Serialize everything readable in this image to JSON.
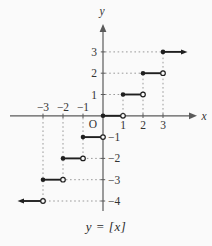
{
  "figure": {
    "caption": "y = [x]",
    "x_axis_label": "x",
    "y_axis_label": "y",
    "origin_label": "O"
  },
  "chart_data": {
    "type": "line",
    "subtype": "step-function",
    "function": "floor",
    "title": "y = [x]",
    "xlabel": "x",
    "ylabel": "y",
    "xlim": [
      -4.6,
      4.7
    ],
    "ylim": [
      -4.6,
      4.4
    ],
    "grid": "dotted-guides-only",
    "colors": {
      "line": "#1f1f1f",
      "axis": "#5a5a5a",
      "guide": "#9a9a9a",
      "label": "#333333",
      "background": "#fafafa"
    },
    "segments": [
      {
        "y": -4,
        "from": -4.05,
        "to": -3,
        "start": "arrow",
        "end": "open"
      },
      {
        "y": -3,
        "from": -3,
        "to": -2,
        "start": "closed",
        "end": "open"
      },
      {
        "y": -2,
        "from": -2,
        "to": -1,
        "start": "closed",
        "end": "open"
      },
      {
        "y": -1,
        "from": -1,
        "to": 0,
        "start": "closed",
        "end": "open"
      },
      {
        "y": 0,
        "from": 0,
        "to": 1,
        "start": "closed",
        "end": "open"
      },
      {
        "y": 1,
        "from": 1,
        "to": 2,
        "start": "closed",
        "end": "open"
      },
      {
        "y": 2,
        "from": 2,
        "to": 3,
        "start": "closed",
        "end": "open"
      },
      {
        "y": 3,
        "from": 3,
        "to": 4.0,
        "start": "closed",
        "end": "arrow"
      }
    ],
    "guides_v": [
      {
        "x": 1,
        "y1": 0,
        "y2": 1
      },
      {
        "x": 2,
        "y1": 0,
        "y2": 2
      },
      {
        "x": 3,
        "y1": 0,
        "y2": 3
      },
      {
        "x": -1,
        "y1": 0,
        "y2": -2
      },
      {
        "x": -2,
        "y1": 0,
        "y2": -3
      },
      {
        "x": -3,
        "y1": 0,
        "y2": -4
      }
    ],
    "guides_h": [
      {
        "y": 1,
        "x1": 0,
        "x2": 1
      },
      {
        "y": 2,
        "x1": 0,
        "x2": 2
      },
      {
        "y": 3,
        "x1": 0,
        "x2": 3
      },
      {
        "y": -2,
        "x1": 0,
        "x2": -1
      },
      {
        "y": -3,
        "x1": 0,
        "x2": -2
      },
      {
        "y": -4,
        "x1": 0,
        "x2": -3
      }
    ],
    "x_ticks": [
      -3,
      -2,
      -1,
      1,
      2,
      3
    ],
    "y_ticks": [
      1,
      2,
      3,
      -1,
      -2,
      -3,
      -4
    ],
    "x_tick_labels": [
      {
        "v": -3,
        "text": "−3",
        "side": "above"
      },
      {
        "v": -2,
        "text": "−2",
        "side": "above"
      },
      {
        "v": -1,
        "text": "−1",
        "side": "above"
      },
      {
        "v": 1,
        "text": "1",
        "side": "below"
      },
      {
        "v": 2,
        "text": "2",
        "side": "below"
      },
      {
        "v": 3,
        "text": "3",
        "side": "below"
      }
    ],
    "y_tick_labels": [
      {
        "v": 1,
        "text": "1",
        "side": "left"
      },
      {
        "v": 2,
        "text": "2",
        "side": "left"
      },
      {
        "v": 3,
        "text": "3",
        "side": "left"
      },
      {
        "v": -1,
        "text": "−1",
        "side": "right"
      },
      {
        "v": -2,
        "text": "−2",
        "side": "right"
      },
      {
        "v": -3,
        "text": "−3",
        "side": "right"
      },
      {
        "v": -4,
        "text": "−4",
        "side": "right"
      }
    ]
  }
}
